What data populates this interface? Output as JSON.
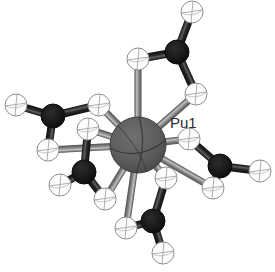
{
  "figure": {
    "kind": "molecular-structure-ortep",
    "background_color": "#ffffff",
    "caption_fragment": "   "
  },
  "labels": [
    {
      "text": "Pu1",
      "x": 170,
      "y": 114,
      "color": "#2b2b2b"
    }
  ],
  "palette": {
    "metal_fill": "#5e5e5e",
    "metal_edge": "#3f3f3f",
    "metal_line": "#3a3a3a",
    "carbon_fill": "#1b1b1b",
    "carbon_edge": "#0d0d0d",
    "hydrogen_fill": "#fdfdfd",
    "hydrogen_edge": "#8d8d8d",
    "hydrogen_line": "#a5a5a5",
    "bond_metal_dark": "#5a5a5a",
    "bond_metal_light": "#b9b9b9",
    "bond_carbon_dark": "#141414",
    "bond_carbon_light": "#545454"
  },
  "atoms": [
    {
      "id": "Pu1",
      "element": "Pu",
      "kind": "metal",
      "x": 138,
      "y": 145,
      "r": 28
    },
    {
      "id": "C1",
      "element": "C",
      "kind": "carbon",
      "x": 177,
      "y": 52,
      "r": 12
    },
    {
      "id": "C2",
      "element": "C",
      "kind": "carbon",
      "x": 53,
      "y": 116,
      "r": 12
    },
    {
      "id": "C3",
      "element": "C",
      "kind": "carbon",
      "x": 84,
      "y": 172,
      "r": 12
    },
    {
      "id": "C4",
      "element": "C",
      "kind": "carbon",
      "x": 153,
      "y": 221,
      "r": 12
    },
    {
      "id": "C5",
      "element": "C",
      "kind": "carbon",
      "x": 220,
      "y": 166,
      "r": 12
    },
    {
      "id": "H1",
      "element": "H",
      "kind": "hydrogen",
      "x": 192,
      "y": 12,
      "r": 11
    },
    {
      "id": "H2",
      "element": "H",
      "kind": "hydrogen",
      "x": 138,
      "y": 59,
      "r": 11
    },
    {
      "id": "H3",
      "element": "H",
      "kind": "hydrogen",
      "x": 196,
      "y": 94,
      "r": 11
    },
    {
      "id": "H4",
      "element": "H",
      "kind": "hydrogen",
      "x": 16,
      "y": 105,
      "r": 11
    },
    {
      "id": "H5",
      "element": "H",
      "kind": "hydrogen",
      "x": 99,
      "y": 105,
      "r": 11
    },
    {
      "id": "H6",
      "element": "H",
      "kind": "hydrogen",
      "x": 48,
      "y": 150,
      "r": 11
    },
    {
      "id": "H7",
      "element": "H",
      "kind": "hydrogen",
      "x": 88,
      "y": 129,
      "r": 11
    },
    {
      "id": "H8",
      "element": "H",
      "kind": "hydrogen",
      "x": 60,
      "y": 185,
      "r": 11
    },
    {
      "id": "H9",
      "element": "H",
      "kind": "hydrogen",
      "x": 105,
      "y": 199,
      "r": 11
    },
    {
      "id": "H10",
      "element": "H",
      "kind": "hydrogen",
      "x": 126,
      "y": 228,
      "r": 11
    },
    {
      "id": "H11",
      "element": "H",
      "kind": "hydrogen",
      "x": 163,
      "y": 253,
      "r": 11
    },
    {
      "id": "H12",
      "element": "H",
      "kind": "hydrogen",
      "x": 166,
      "y": 178,
      "r": 11
    },
    {
      "id": "H13",
      "element": "H",
      "kind": "hydrogen",
      "x": 189,
      "y": 139,
      "r": 11
    },
    {
      "id": "H14",
      "element": "H",
      "kind": "hydrogen",
      "x": 260,
      "y": 171,
      "r": 11
    },
    {
      "id": "H15",
      "element": "H",
      "kind": "hydrogen",
      "x": 213,
      "y": 188,
      "r": 11
    }
  ],
  "bonds": [
    {
      "from": "Pu1",
      "to": "H2",
      "style": "metal",
      "w": 7
    },
    {
      "from": "Pu1",
      "to": "H3",
      "style": "metal",
      "w": 7
    },
    {
      "from": "Pu1",
      "to": "H5",
      "style": "metal",
      "w": 7
    },
    {
      "from": "Pu1",
      "to": "H6",
      "style": "metal",
      "w": 7
    },
    {
      "from": "Pu1",
      "to": "H7",
      "style": "metal",
      "w": 7
    },
    {
      "from": "Pu1",
      "to": "H9",
      "style": "metal",
      "w": 7
    },
    {
      "from": "Pu1",
      "to": "H10",
      "style": "metal",
      "w": 7
    },
    {
      "from": "Pu1",
      "to": "H12",
      "style": "metal",
      "w": 7
    },
    {
      "from": "Pu1",
      "to": "H13",
      "style": "metal",
      "w": 7
    },
    {
      "from": "Pu1",
      "to": "H15",
      "style": "metal",
      "w": 7
    },
    {
      "from": "C1",
      "to": "H1",
      "style": "carbon",
      "w": 8
    },
    {
      "from": "C1",
      "to": "H2",
      "style": "carbon",
      "w": 8
    },
    {
      "from": "C1",
      "to": "H3",
      "style": "carbon",
      "w": 8
    },
    {
      "from": "C2",
      "to": "H4",
      "style": "carbon",
      "w": 8
    },
    {
      "from": "C2",
      "to": "H5",
      "style": "carbon",
      "w": 8
    },
    {
      "from": "C2",
      "to": "H6",
      "style": "carbon",
      "w": 8
    },
    {
      "from": "C3",
      "to": "H7",
      "style": "carbon",
      "w": 8
    },
    {
      "from": "C3",
      "to": "H8",
      "style": "carbon",
      "w": 8
    },
    {
      "from": "C3",
      "to": "H9",
      "style": "carbon",
      "w": 8
    },
    {
      "from": "C4",
      "to": "H10",
      "style": "carbon",
      "w": 8
    },
    {
      "from": "C4",
      "to": "H11",
      "style": "carbon",
      "w": 8
    },
    {
      "from": "C4",
      "to": "H12",
      "style": "carbon",
      "w": 8
    },
    {
      "from": "C5",
      "to": "H13",
      "style": "carbon",
      "w": 8
    },
    {
      "from": "C5",
      "to": "H14",
      "style": "carbon",
      "w": 8
    },
    {
      "from": "C5",
      "to": "H15",
      "style": "carbon",
      "w": 8
    }
  ]
}
